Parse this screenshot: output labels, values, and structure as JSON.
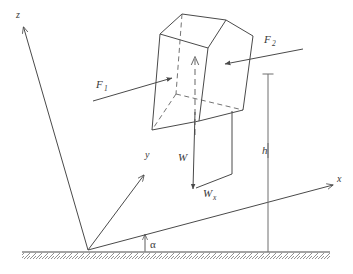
{
  "figure": {
    "background_color": "#ffffff",
    "line_color": "#4a4a4a",
    "label_color": "#3a3a3a"
  },
  "axes": {
    "z": {
      "label": "z",
      "description": "tilted vertical axis pointing up-left"
    },
    "y": {
      "label": "y",
      "description": "axis pointing up-right into the incline plane"
    },
    "x": {
      "label": "x",
      "description": "axis along the incline surface pointing right"
    }
  },
  "angle": {
    "label": "α",
    "name": "alpha",
    "description": "inclination angle between ground and x-axis"
  },
  "height": {
    "label": "h",
    "description": "vertical height dimension line"
  },
  "forces": [
    {
      "name": "F1",
      "label": "F",
      "subscript": "1",
      "direction": "pointing right into the left face of the block"
    },
    {
      "name": "F2",
      "label": "F",
      "subscript": "2",
      "direction": "pointing left into the right face of the block"
    },
    {
      "name": "W",
      "label": "W",
      "subscript": "",
      "direction": "weight, pointing straight down from block centre"
    },
    {
      "name": "Wx",
      "label": "W",
      "subscript": "x",
      "direction": "component of weight along the x-axis"
    }
  ],
  "objects": {
    "block": {
      "name": "block",
      "description": "wireframe cube resting above the inclined plane"
    },
    "ground": {
      "name": "ground",
      "description": "hatched horizontal ground line"
    }
  }
}
